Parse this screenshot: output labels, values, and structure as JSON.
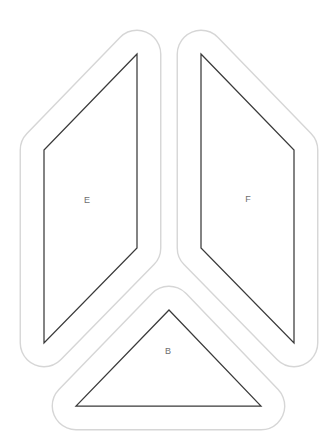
{
  "canvas": {
    "width": 335,
    "height": 444,
    "background": "#ffffff"
  },
  "colors": {
    "seam_outline": "#d6d6d6",
    "piece_outline": "#3a3a3a",
    "label_text": "#6e6e6e",
    "piece_fill": "#ffffff"
  },
  "seam": {
    "offset_px": 23.75,
    "outline_width_px": 1.4,
    "piece_line_width_px": 1.25
  },
  "label_font_size_px": 9,
  "pieces": [
    {
      "label": "E",
      "points": [
        [
          137,
          54
        ],
        [
          44,
          150
        ],
        [
          44,
          343
        ],
        [
          137,
          248
        ]
      ],
      "label_pos": [
        87,
        200
      ]
    },
    {
      "label": "F",
      "points": [
        [
          201,
          54
        ],
        [
          294,
          150
        ],
        [
          294,
          343
        ],
        [
          201,
          248
        ]
      ],
      "label_pos": [
        248,
        199
      ]
    },
    {
      "label": "B",
      "points": [
        [
          169,
          310
        ],
        [
          261,
          406
        ],
        [
          76,
          406
        ]
      ],
      "label_pos": [
        168,
        351
      ]
    }
  ]
}
